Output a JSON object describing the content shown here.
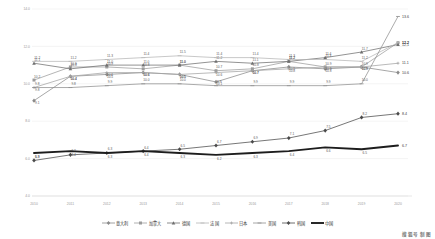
{
  "chart_data": {
    "type": "line",
    "title": "",
    "xlabel": "",
    "ylabel": "",
    "ylim": [
      4.0,
      14.0
    ],
    "ytick_labels": [
      "14.0",
      "12.0",
      "10.0",
      "8.0",
      "6.0",
      "4.0"
    ],
    "ytick_values": [
      14.0,
      12.0,
      10.0,
      8.0,
      6.0,
      4.0
    ],
    "grid": true,
    "legend_position": "bottom",
    "categories": [
      "2010",
      "2011",
      "2012",
      "2013",
      "2014",
      "2015",
      "2016",
      "2017",
      "2018",
      "2019",
      "2020"
    ],
    "series": [
      {
        "name": "意大利",
        "color": "#8a8a8a",
        "marker": "diamond",
        "values": [
          9.1,
          10.4,
          10.5,
          10.6,
          10.5,
          10.1,
          10.7,
          10.9,
          10.8,
          10.9,
          10.6
        ],
        "labels": [
          "9.1",
          "10.4",
          "10.5",
          "10.6",
          "10.5",
          "10.1",
          "10.7",
          "10.9",
          "10.8",
          "10.9",
          "10.6"
        ],
        "end_label": "10.6"
      },
      {
        "name": "加拿大",
        "color": "#9c9c9c",
        "marker": "square",
        "values": [
          10.2,
          10.9,
          10.9,
          10.8,
          11.0,
          10.7,
          10.8,
          11.2,
          10.9,
          10.9,
          12.2
        ],
        "labels": [
          "10.2",
          "10.9",
          "10.9",
          "10.8",
          "11.0",
          "10.7",
          "10.8",
          "11.2",
          "10.9",
          "10.9",
          "12.2"
        ],
        "end_label": "12.2"
      },
      {
        "name": "德国",
        "color": "#6f6f6f",
        "marker": "triangle",
        "values": [
          11.1,
          10.8,
          11.0,
          11.0,
          11.0,
          11.2,
          11.1,
          11.2,
          11.4,
          11.7,
          12.1
        ],
        "labels": [
          "11.1",
          "10.8",
          "11.0",
          "11.0",
          "11.0",
          "11.2",
          "11.1",
          "11.2",
          "11.4",
          "11.7",
          "12.1"
        ],
        "end_label": "12.1"
      },
      {
        "name": "法国",
        "color": "#b5b5b5",
        "marker": "line",
        "values": [
          11.2,
          11.2,
          11.3,
          11.4,
          11.5,
          11.4,
          11.4,
          11.3,
          11.3,
          11.2,
          12.2
        ],
        "labels": [
          "11.2",
          "11.2",
          "11.3",
          "11.4",
          "11.5",
          "11.4",
          "11.4",
          "11.3",
          "11.3",
          "11.2",
          "12.2"
        ],
        "end_label": "12.2"
      },
      {
        "name": "日本",
        "color": "#a3a3a3",
        "marker": "cross",
        "values": [
          9.8,
          10.4,
          10.6,
          10.6,
          10.5,
          10.6,
          10.7,
          10.8,
          10.9,
          10.9,
          11.1
        ],
        "labels": [
          "9.8",
          "10.4",
          "10.6",
          "10.6",
          "10.5",
          "10.6",
          "10.7",
          "10.8",
          "10.9",
          "10.9",
          "11.1"
        ],
        "end_label": "11.1"
      },
      {
        "name": "美国",
        "color": "#8f8f8f",
        "marker": "dash",
        "values": [
          9.8,
          9.8,
          9.9,
          10.0,
          10.0,
          9.9,
          9.9,
          9.9,
          9.9,
          10.0,
          13.6
        ],
        "labels": [
          "9.8",
          "9.8",
          "9.9",
          "10.0",
          "10.0",
          "9.9",
          "9.9",
          "9.9",
          "9.9",
          "10.0",
          "13.6"
        ],
        "end_label": "13.6"
      },
      {
        "name": "韩国",
        "color": "#4a4a4a",
        "marker": "diamond",
        "values": [
          5.9,
          6.2,
          6.3,
          6.4,
          6.5,
          6.7,
          6.9,
          7.1,
          7.5,
          8.2,
          8.4
        ],
        "labels": [
          "5.9",
          "6.2",
          "6.3",
          "6.4",
          "6.5",
          "6.7",
          "6.9",
          "7.1",
          "7.5",
          "8.2",
          "8.4"
        ],
        "end_label": "8.4"
      },
      {
        "name": "中国",
        "color": "#1d1d1d",
        "marker": "none",
        "values": [
          6.3,
          6.4,
          6.3,
          6.4,
          6.3,
          6.2,
          6.3,
          6.4,
          6.6,
          6.5,
          6.7
        ],
        "labels": [
          "6.3",
          "6.4",
          "6.3",
          "6.4",
          "6.3",
          "6.2",
          "6.3",
          "6.4",
          "6.6",
          "6.5",
          "6.7"
        ],
        "end_label": "6.7"
      }
    ],
    "secondary_labels_below": [
      "5.8",
      "6.0",
      "6.1",
      "6.2",
      "6.3"
    ]
  },
  "watermark": {
    "text": "搜狐号 制图"
  }
}
